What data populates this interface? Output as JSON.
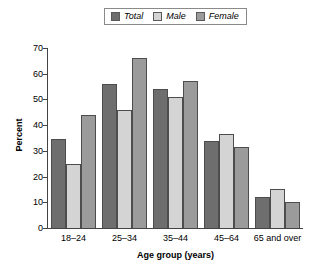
{
  "chart_data": {
    "type": "bar",
    "title": "",
    "xlabel": "Age group (years)",
    "ylabel": "Percent",
    "ylim": [
      0,
      70
    ],
    "yticks": [
      0,
      10,
      20,
      30,
      40,
      50,
      60,
      70
    ],
    "grid": false,
    "legend_position": "top-center",
    "categories": [
      "18–24",
      "25–34",
      "35–44",
      "45–64",
      "65 and over"
    ],
    "series": [
      {
        "name": "Total",
        "color": "#6e6e6e",
        "values": [
          34.5,
          56,
          54,
          34,
          12
        ]
      },
      {
        "name": "Male",
        "color": "#d4d4d4",
        "values": [
          25,
          46,
          51,
          36.5,
          15
        ]
      },
      {
        "name": "Female",
        "color": "#9b9b9b",
        "values": [
          44,
          66,
          57,
          31.5,
          10
        ]
      }
    ]
  },
  "legend": {
    "entries": [
      {
        "label": "Total"
      },
      {
        "label": "Male"
      },
      {
        "label": "Female"
      }
    ]
  },
  "axes": {
    "y_title": "Percent",
    "x_title": "Age group (years)",
    "y_tick_labels": [
      "0",
      "10",
      "20",
      "30",
      "40",
      "50",
      "60",
      "70"
    ],
    "x_tick_labels": [
      "18–24",
      "25–34",
      "35–44",
      "45–64",
      "65 and over"
    ]
  }
}
